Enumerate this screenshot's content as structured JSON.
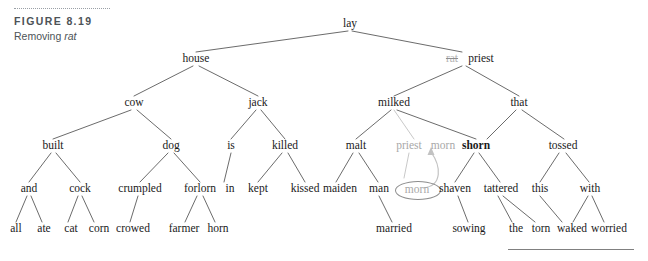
{
  "figure": {
    "label": "FIGURE 8.19",
    "caption_prefix": "Removing ",
    "caption_italic": "rat"
  },
  "diagram": {
    "type": "parse-tree",
    "removed_word": "rat",
    "moved_word": "morn"
  },
  "nodes": {
    "lay": "lay",
    "house": "house",
    "rat": "rat",
    "priest_top": "priest",
    "cow": "cow",
    "jack": "jack",
    "milked": "milked",
    "that": "that",
    "built": "built",
    "dog": "dog",
    "is": "is",
    "killed": "killed",
    "malt": "malt",
    "priest_grey": "priest",
    "morn_grey": "morn",
    "shorn": "shorn",
    "tossed": "tossed",
    "and": "and",
    "cock": "cock",
    "crumpled": "crumpled",
    "forlorn": "forlorn",
    "in": "in",
    "kept": "kept",
    "kissed": "kissed",
    "maiden": "maiden",
    "man": "man",
    "morn_circled": "morn",
    "shaven": "shaven",
    "tattered": "tattered",
    "this": "this",
    "with": "with",
    "all": "all",
    "ate": "ate",
    "cat": "cat",
    "corn": "corn",
    "crowed": "crowed",
    "farmer": "farmer",
    "horn": "horn",
    "married": "married",
    "sowing": "sowing",
    "the": "the",
    "torn": "torn",
    "waked": "waked",
    "worried": "worried"
  },
  "colors": {
    "text": "#1a1a1a",
    "greyed": "#a8a8a8",
    "edge": "#5a5a5a",
    "edge_grey": "#bdbdbd",
    "caption": "#4d5357",
    "circle": "#8d8d8d"
  }
}
